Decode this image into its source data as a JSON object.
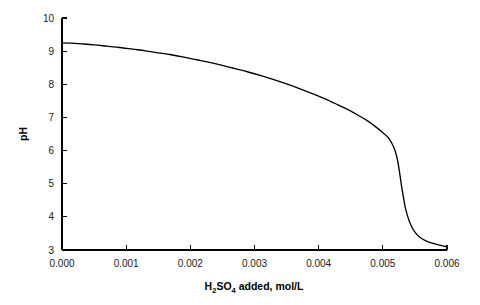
{
  "chart_data": {
    "type": "line",
    "title": "",
    "subtitle": "",
    "xlabel_parts": {
      "pre": "H",
      "sub1": "2",
      "mid": "SO",
      "sub2": "4",
      "post": " added, mol/L"
    },
    "xlabel": "H2SO4 added, mol/L",
    "ylabel": "pH",
    "xlim": [
      0.0,
      0.006
    ],
    "ylim": [
      3,
      10
    ],
    "grid": false,
    "legend": false,
    "legend_position": "none",
    "xticks": [
      0.0,
      0.001,
      0.002,
      0.003,
      0.004,
      0.005,
      0.006
    ],
    "xtick_labels": [
      "0.000",
      "0.001",
      "0.002",
      "0.003",
      "0.004",
      "0.005",
      "0.006"
    ],
    "yticks": [
      3,
      4,
      5,
      6,
      7,
      8,
      9,
      10
    ],
    "ytick_labels": [
      "3",
      "4",
      "5",
      "6",
      "7",
      "8",
      "9",
      "10"
    ],
    "tick_direction": "in",
    "spines_visible": [
      "left",
      "bottom"
    ],
    "series": [
      {
        "name": "titration curve",
        "color": "#000000",
        "x": [
          0.0,
          0.00015,
          0.0003,
          0.0005,
          0.0007,
          0.0009,
          0.0011,
          0.0013,
          0.0015,
          0.0017,
          0.0019,
          0.0021,
          0.0023,
          0.0025,
          0.0027,
          0.0029,
          0.0031,
          0.0033,
          0.0035,
          0.0037,
          0.0039,
          0.0041,
          0.0043,
          0.00445,
          0.0046,
          0.00475,
          0.0049,
          0.005,
          0.00508,
          0.00514,
          0.00519,
          0.00523,
          0.00526,
          0.00529,
          0.00532,
          0.00535,
          0.00539,
          0.00544,
          0.0055,
          0.00558,
          0.00568,
          0.0058,
          0.00592,
          0.006
        ],
        "y": [
          9.25,
          9.24,
          9.22,
          9.19,
          9.15,
          9.11,
          9.06,
          9.01,
          8.95,
          8.89,
          8.82,
          8.74,
          8.66,
          8.57,
          8.47,
          8.37,
          8.26,
          8.14,
          8.01,
          7.87,
          7.72,
          7.56,
          7.38,
          7.24,
          7.08,
          6.91,
          6.7,
          6.54,
          6.4,
          6.22,
          6.0,
          5.7,
          5.35,
          4.95,
          4.6,
          4.28,
          4.0,
          3.74,
          3.54,
          3.38,
          3.27,
          3.19,
          3.13,
          3.1
        ]
      }
    ]
  }
}
